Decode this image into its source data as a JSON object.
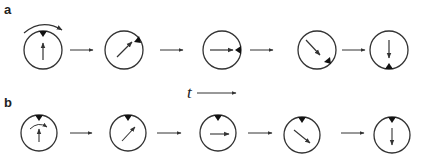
{
  "panels": [
    {
      "label": "a",
      "description": "Dial rotates clockwise; marker moves with dial edge, pointer rotates",
      "frames": [
        {
          "pointer_angle_deg": 0,
          "marker_angle_deg": 0
        },
        {
          "pointer_angle_deg": 45,
          "marker_angle_deg": 45
        },
        {
          "pointer_angle_deg": 90,
          "marker_angle_deg": 90
        },
        {
          "pointer_angle_deg": 135,
          "marker_angle_deg": 135
        },
        {
          "pointer_angle_deg": 180,
          "marker_angle_deg": 180
        }
      ],
      "has_external_rotation_arrow": true
    },
    {
      "label": "b",
      "description": "Marker fixed at top; pointer rotates inside dial",
      "frames": [
        {
          "pointer_angle_deg": 0,
          "marker_angle_deg": 0
        },
        {
          "pointer_angle_deg": 45,
          "marker_angle_deg": 0
        },
        {
          "pointer_angle_deg": 90,
          "marker_angle_deg": 0
        },
        {
          "pointer_angle_deg": 135,
          "marker_angle_deg": 0
        },
        {
          "pointer_angle_deg": 180,
          "marker_angle_deg": 0
        }
      ],
      "has_internal_rotation_arrow": true
    }
  ],
  "time_axis": {
    "label": "t"
  },
  "colors": {
    "stroke": "#333333",
    "marker": "#111111"
  }
}
